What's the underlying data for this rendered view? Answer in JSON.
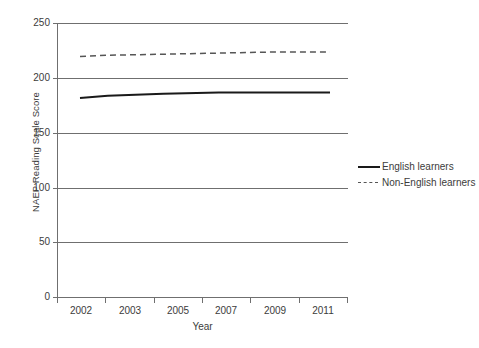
{
  "chart_data": {
    "type": "line",
    "title": "",
    "xlabel": "Year",
    "ylabel": "NAEP Reading Scale Score",
    "categories": [
      "2002",
      "2003",
      "2005",
      "2007",
      "2009",
      "2011"
    ],
    "x": [
      2002,
      2003,
      2005,
      2007,
      2009,
      2011
    ],
    "xlim": [
      2002,
      2011
    ],
    "ylim": [
      0,
      250
    ],
    "y_ticks": [
      0,
      50,
      100,
      150,
      200,
      250
    ],
    "y_tick_labels": [
      "0",
      "50",
      "100",
      "150",
      "200",
      "250"
    ],
    "grid": "horizontal",
    "legend_position": "right",
    "series": [
      {
        "name": "English learners",
        "style": "solid",
        "color": "#1a1a1a",
        "values": [
          182,
          184,
          186,
          187,
          187,
          187
        ]
      },
      {
        "name": "Non-English learners",
        "style": "dashed",
        "color": "#555555",
        "values": [
          220,
          221,
          222,
          223,
          224,
          224
        ]
      }
    ]
  },
  "axes": {
    "y_title": "NAEP Reading Scale Score",
    "x_title": "Year",
    "y_tick_labels": [
      "250",
      "200",
      "150",
      "100",
      "50",
      "0"
    ],
    "x_tick_labels": [
      "2002",
      "2003",
      "2005",
      "2007",
      "2009",
      "2011"
    ]
  },
  "legend": {
    "items": [
      {
        "label": "English learners",
        "style": "solid"
      },
      {
        "label": "Non-English learners",
        "style": "dashed"
      }
    ]
  },
  "colors": {
    "english_learners": "#1a1a1a",
    "non_english_learners": "#555555",
    "gridline": "#6f6f6f",
    "axis": "#6f6f6f",
    "text": "#3c3c3b",
    "background": "#ffffff"
  }
}
